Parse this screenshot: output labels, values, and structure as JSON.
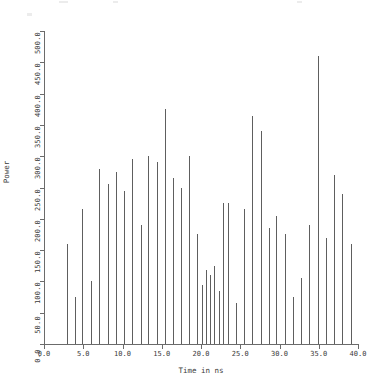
{
  "chart_data": {
    "type": "bar",
    "title": "",
    "xlabel": "Time in ns",
    "ylabel": "Power",
    "xlim": [
      0.0,
      40.0
    ],
    "ylim": [
      0.0,
      500.0
    ],
    "xticks": [
      "0.0",
      "5.0",
      "10.0",
      "15.0",
      "20.0",
      "25.0",
      "30.0",
      "35.0",
      "40.0"
    ],
    "xtick_values": [
      0,
      5,
      10,
      15,
      20,
      25,
      30,
      35,
      40
    ],
    "yticks": [
      "0.0",
      "50.0",
      "100.0",
      "150.0",
      "200.0",
      "250.0",
      "300.0",
      "350.0",
      "400.0",
      "450.0",
      "500.0"
    ],
    "ytick_values": [
      0,
      50,
      100,
      150,
      200,
      250,
      300,
      350,
      400,
      450,
      500
    ],
    "grid": false,
    "legend": null,
    "line_color": "#5e5e5e",
    "axis_color": "#6b6b6b",
    "x": [
      2.9,
      3.9,
      4.9,
      6.0,
      7.0,
      8.1,
      9.2,
      10.2,
      11.2,
      12.3,
      13.3,
      14.4,
      15.4,
      16.4,
      17.5,
      18.5,
      19.5,
      20.1,
      20.6,
      21.2,
      21.7,
      22.3,
      22.8,
      23.4,
      24.4,
      25.5,
      26.5,
      27.6,
      28.6,
      29.6,
      30.7,
      31.7,
      32.8,
      33.8,
      34.9,
      35.9,
      37.0,
      38.0,
      39.1
    ],
    "values": [
      160,
      75,
      215,
      100,
      280,
      255,
      275,
      245,
      295,
      190,
      300,
      290,
      375,
      265,
      250,
      300,
      175,
      95,
      118,
      110,
      125,
      85,
      225,
      225,
      65,
      215,
      365,
      340,
      185,
      205,
      175,
      75,
      105,
      190,
      460,
      170,
      270,
      240,
      160
    ]
  },
  "axis_titles": {
    "x": "Time in ns",
    "y": "Power"
  }
}
